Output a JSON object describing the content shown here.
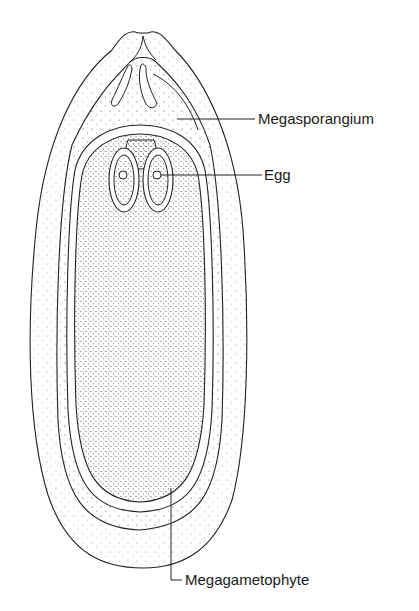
{
  "diagram": {
    "labels": {
      "megasporangium": "Megasporangium",
      "egg": "Egg",
      "megagametophyte": "Megagametophyte"
    },
    "colors": {
      "line": "#222222",
      "stipple_light": "#9a9a9a",
      "stipple_dark": "#555555",
      "background": "#ffffff"
    }
  }
}
